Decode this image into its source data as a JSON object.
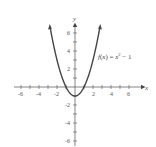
{
  "chart_data": {
    "type": "line",
    "title": "",
    "function": "f(x) = x^2 - 1",
    "annotation": "f(x) = x² − 1",
    "xlabel": "x",
    "ylabel": "y",
    "xlim": [
      -6.5,
      7
    ],
    "ylim": [
      -6.5,
      7
    ],
    "x_ticks": [
      -6,
      -5,
      -4,
      -3,
      -2,
      -1,
      1,
      2,
      3,
      4,
      5,
      6
    ],
    "x_tick_labels": [
      "-6",
      "-4",
      "-2",
      "2",
      "4",
      "6"
    ],
    "y_ticks": [
      -6,
      -5,
      -4,
      -3,
      -2,
      -1,
      1,
      2,
      3,
      4,
      5,
      6
    ],
    "y_tick_labels": [
      "6",
      "4",
      "2",
      "-2",
      "-4",
      "-6"
    ],
    "grid": false,
    "legend": false,
    "series": [
      {
        "name": "f(x) = x^2 - 1",
        "x": [
          -2.8,
          -2.5,
          -2,
          -1.5,
          -1,
          -0.5,
          0,
          0.5,
          1,
          1.5,
          2,
          2.5,
          2.8
        ],
        "y": [
          6.84,
          5.25,
          3,
          1.25,
          0,
          -0.75,
          -1,
          -0.75,
          0,
          1.25,
          3,
          5.25,
          6.84
        ]
      }
    ]
  },
  "labels": {
    "x_axis": "x",
    "y_axis": "y",
    "function": "f(x) = x² − 1",
    "xt": [
      "-6",
      "-4",
      "-2",
      "2",
      "4",
      "6"
    ],
    "yt": [
      "6",
      "4",
      "2",
      "-2",
      "-4",
      "-6"
    ]
  }
}
